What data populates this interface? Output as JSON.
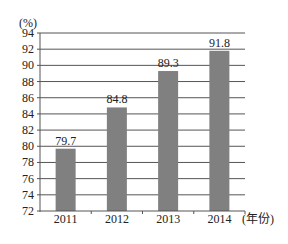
{
  "chart_data": {
    "type": "bar",
    "title": "",
    "xlabel": "(年份)",
    "ylabel": "(%)",
    "categories": [
      "2011",
      "2012",
      "2013",
      "2014"
    ],
    "values": [
      79.7,
      84.8,
      89.3,
      91.8
    ],
    "data_labels": [
      "79.7",
      "84.8",
      "89.3",
      "91.8"
    ],
    "ylim": [
      72,
      94
    ],
    "yticks": [
      "72",
      "74",
      "76",
      "78",
      "80",
      "82",
      "84",
      "86",
      "88",
      "90",
      "92",
      "94"
    ],
    "grid": true,
    "legend": "none",
    "bar_color": "#808080"
  }
}
